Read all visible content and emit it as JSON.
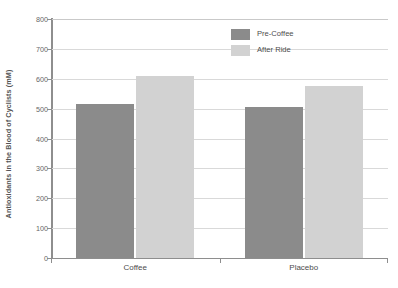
{
  "chart_data": {
    "type": "bar",
    "title": "",
    "subtitle": "",
    "xlabel": "",
    "ylabel": "Antioxidants in the Blood of Cyclists (mM)",
    "categories": [
      "Coffee",
      "Placebo"
    ],
    "series": [
      {
        "name": "Pre-Coffee",
        "values": [
          515,
          505
        ],
        "color": "#8b8b8b"
      },
      {
        "name": "After Ride",
        "values": [
          610,
          575
        ],
        "color": "#d2d2d2"
      }
    ],
    "ylim": [
      0,
      800
    ],
    "yticks": [
      0,
      100,
      200,
      300,
      400,
      500,
      600,
      700,
      800
    ],
    "ytick_labels": [
      "0",
      "100",
      "200",
      "300",
      "400",
      "500",
      "600",
      "700",
      "800"
    ],
    "grid": true,
    "grid_axis": "y",
    "legend_position": "top-center-right",
    "background_color": "#ffffff",
    "axis_color": "#8e8e8e",
    "gridline_color": "#d9d9d9",
    "text_color": "#4d4d4d"
  },
  "legend": {
    "items": [
      {
        "label": "Pre-Coffee",
        "swatch": "#8b8b8b"
      },
      {
        "label": "After Ride",
        "swatch": "#d2d2d2"
      }
    ]
  },
  "axes": {
    "y_title": "Antioxidants in the Blood of Cyclists (mM)",
    "y_ticks": [
      "0",
      "100",
      "200",
      "300",
      "400",
      "500",
      "600",
      "700",
      "800"
    ],
    "x_ticks": [
      "Coffee",
      "Placebo"
    ]
  }
}
